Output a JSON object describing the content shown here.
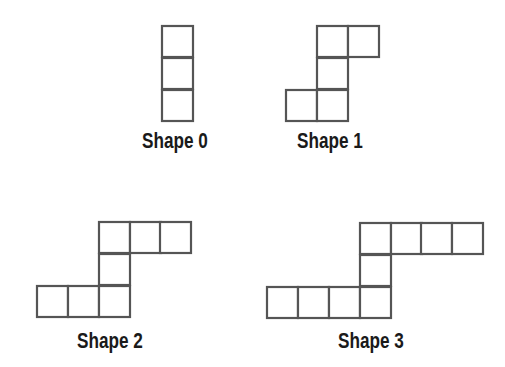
{
  "diagram": {
    "type": "pattern-sequence",
    "cell_size": 31,
    "stroke_color": "#555555",
    "label_color": "#1a1a1a",
    "shapes": [
      {
        "label": "Shape 0",
        "label_pos": [
          142,
          130
        ],
        "cells": [
          [
            162,
            26
          ],
          [
            162,
            58
          ],
          [
            162,
            90
          ]
        ]
      },
      {
        "label": "Shape 1",
        "label_pos": [
          297,
          130
        ],
        "cells": [
          [
            317,
            26
          ],
          [
            348,
            26
          ],
          [
            317,
            58
          ],
          [
            286,
            90
          ],
          [
            317,
            90
          ]
        ]
      },
      {
        "label": "Shape 2",
        "label_pos": [
          77,
          330
        ],
        "cells": [
          [
            99,
            222
          ],
          [
            130,
            222
          ],
          [
            160,
            222
          ],
          [
            99,
            254
          ],
          [
            37,
            286
          ],
          [
            68,
            286
          ],
          [
            99,
            286
          ]
        ]
      },
      {
        "label": "Shape 3",
        "label_pos": [
          338,
          330
        ],
        "cells": [
          [
            360,
            223
          ],
          [
            391,
            223
          ],
          [
            421,
            223
          ],
          [
            452,
            223
          ],
          [
            360,
            255
          ],
          [
            267,
            287
          ],
          [
            298,
            287
          ],
          [
            329,
            287
          ],
          [
            360,
            287
          ]
        ]
      }
    ]
  }
}
